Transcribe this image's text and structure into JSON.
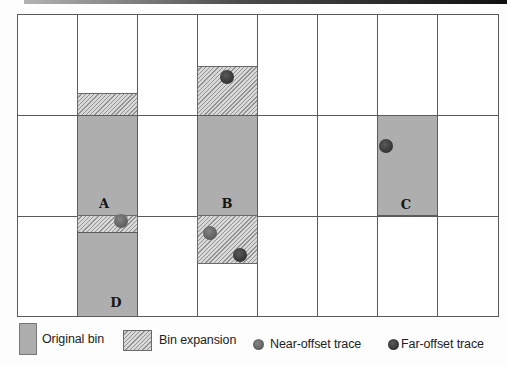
{
  "colors": {
    "page_bg": "#fdfdfd",
    "grid_line": "#5a5a5a",
    "original_bin": "#aeaeae",
    "expansion_bg": "#d8d8d8",
    "expansion_line": "#939393",
    "near_offset": "#5d5d5d",
    "far_offset": "#333333",
    "top_bar_left": "#b3b3b3",
    "top_bar_right": "#101010",
    "text": "#222222"
  },
  "diagram": {
    "grid": {
      "left": 17,
      "top": 14,
      "width": 482,
      "height": 303,
      "cols": 8,
      "rows": 3,
      "col_lines_x": [
        77,
        137,
        197,
        257,
        317,
        377,
        437
      ],
      "row_lines_y": [
        115,
        216
      ]
    },
    "regions": [
      {
        "name": "bin-B-expansion-top",
        "type": "expansion",
        "x": 197,
        "y": 66,
        "w": 61,
        "h": 50
      },
      {
        "name": "bin-A-expansion-top",
        "type": "expansion",
        "x": 77,
        "y": 93,
        "w": 61,
        "h": 23
      },
      {
        "name": "bin-A-original",
        "type": "original",
        "x": 77,
        "y": 115,
        "w": 61,
        "h": 101
      },
      {
        "name": "bin-B-original",
        "type": "original",
        "x": 197,
        "y": 115,
        "w": 61,
        "h": 101
      },
      {
        "name": "bin-C-original",
        "type": "original",
        "x": 377,
        "y": 115,
        "w": 61,
        "h": 101
      },
      {
        "name": "bin-A-expansion-bottom",
        "type": "expansion",
        "x": 77,
        "y": 215,
        "w": 61,
        "h": 18
      },
      {
        "name": "bin-B-expansion-bottom",
        "type": "expansion",
        "x": 197,
        "y": 215,
        "w": 61,
        "h": 49
      },
      {
        "name": "bin-D-original",
        "type": "original",
        "x": 77,
        "y": 232,
        "w": 61,
        "h": 85
      }
    ],
    "bin_labels": [
      {
        "label": "A",
        "x": 104,
        "y": 203
      },
      {
        "label": "B",
        "x": 227,
        "y": 203
      },
      {
        "label": "C",
        "x": 406,
        "y": 204
      },
      {
        "label": "D",
        "x": 116,
        "y": 302
      }
    ],
    "traces": [
      {
        "type": "far",
        "x": 227,
        "y": 77,
        "r": 7
      },
      {
        "type": "far",
        "x": 386,
        "y": 146,
        "r": 7
      },
      {
        "type": "near",
        "x": 121,
        "y": 221,
        "r": 7
      },
      {
        "type": "near",
        "x": 210,
        "y": 233,
        "r": 7
      },
      {
        "type": "far",
        "x": 240,
        "y": 255,
        "r": 7
      }
    ]
  },
  "legend": {
    "items": [
      {
        "label": "Original bin",
        "swatch": "original"
      },
      {
        "label": "Bin expansion",
        "swatch": "expansion"
      },
      {
        "label": "Near-offset trace",
        "swatch": "near-dot"
      },
      {
        "label": "Far-offset trace",
        "swatch": "far-dot"
      }
    ]
  }
}
